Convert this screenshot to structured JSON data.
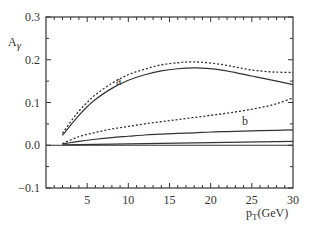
{
  "chart_data": {
    "type": "line",
    "title": "",
    "xlabel": "p_T(GeV)",
    "ylabel": "A_γ",
    "xlim": [
      0,
      30
    ],
    "ylim": [
      -0.1,
      0.3
    ],
    "xticks": [
      5,
      10,
      15,
      20,
      25,
      30
    ],
    "yticks": [
      -0.1,
      0.0,
      0.1,
      0.2,
      0.3
    ],
    "xtick_labels": [
      "5",
      "10",
      "15",
      "20",
      "25",
      "30"
    ],
    "ytick_labels": [
      "-0.1",
      "0.0",
      "0.1",
      "0.2",
      "0.3"
    ],
    "grid": false,
    "legend": null,
    "annotations": [
      {
        "text": "a",
        "x": 8.5,
        "y": 0.14
      },
      {
        "text": "b",
        "x": 23.8,
        "y": 0.048
      }
    ],
    "series": [
      {
        "name": "a (dotted)",
        "style": "dotted",
        "x": [
          2,
          3,
          4,
          5,
          6,
          8,
          10,
          12,
          14,
          16,
          17.5,
          19,
          21,
          23,
          25,
          27,
          28,
          30
        ],
        "y": [
          0.028,
          0.055,
          0.08,
          0.1,
          0.118,
          0.145,
          0.165,
          0.178,
          0.188,
          0.193,
          0.195,
          0.194,
          0.19,
          0.183,
          0.176,
          0.172,
          0.171,
          0.17
        ]
      },
      {
        "name": "a (solid)",
        "style": "solid",
        "x": [
          2,
          3,
          4,
          5,
          6,
          8,
          10,
          12,
          14,
          16,
          18,
          19.5,
          21,
          23,
          25,
          27,
          30
        ],
        "y": [
          0.023,
          0.047,
          0.07,
          0.09,
          0.107,
          0.133,
          0.152,
          0.165,
          0.174,
          0.179,
          0.181,
          0.18,
          0.177,
          0.17,
          0.162,
          0.154,
          0.142
        ]
      },
      {
        "name": "b (dotted)",
        "style": "dotted",
        "x": [
          2,
          4,
          6,
          8,
          10,
          12,
          14,
          16,
          18,
          20,
          22,
          24,
          26,
          28,
          30
        ],
        "y": [
          0.004,
          0.02,
          0.03,
          0.038,
          0.044,
          0.05,
          0.055,
          0.06,
          0.065,
          0.07,
          0.075,
          0.081,
          0.088,
          0.097,
          0.111
        ]
      },
      {
        "name": "b (solid)",
        "style": "solid",
        "x": [
          2,
          4,
          6,
          8,
          10,
          12,
          14,
          16,
          18,
          20,
          22,
          24,
          26,
          28,
          30
        ],
        "y": [
          0.003,
          0.009,
          0.014,
          0.018,
          0.021,
          0.024,
          0.026,
          0.028,
          0.029,
          0.031,
          0.032,
          0.033,
          0.034,
          0.035,
          0.036
        ]
      },
      {
        "name": "baseline (solid)",
        "style": "solid",
        "x": [
          2,
          30
        ],
        "y": [
          0.001,
          0.009
        ]
      }
    ]
  }
}
